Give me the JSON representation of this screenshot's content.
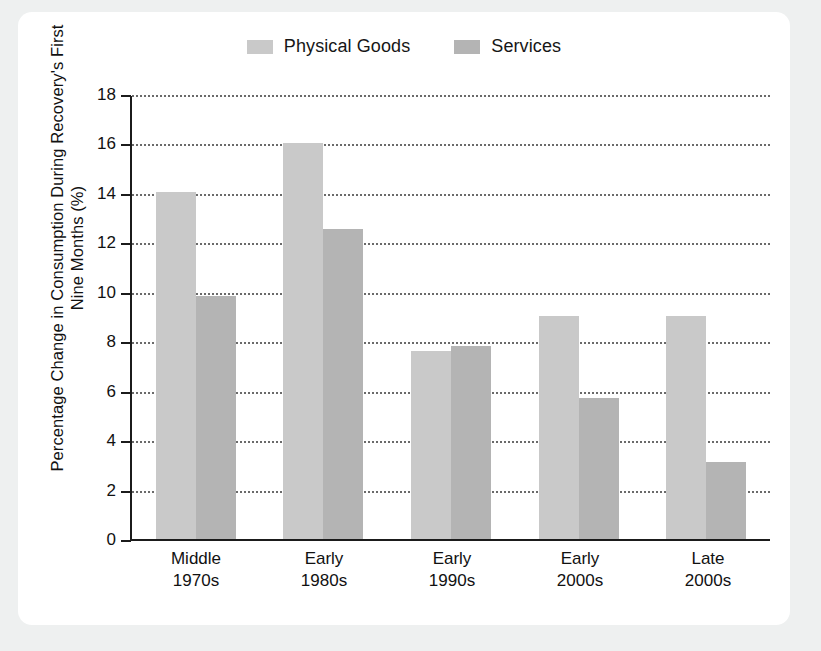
{
  "chart_data": {
    "type": "bar",
    "title": "",
    "xlabel": "",
    "ylabel": "Percentage Change in Consumption During Recovery's First Nine Months (%)",
    "ylim": [
      0,
      18
    ],
    "ytick_step": 2,
    "yticks": [
      "18",
      "16",
      "14",
      "12",
      "10",
      "8",
      "6",
      "4",
      "2",
      "0"
    ],
    "grid": true,
    "legend_position": "top-center",
    "categories": [
      "Middle 1970s",
      "Early 1980s",
      "Early 1990s",
      "Early 2000s",
      "Late 2000s"
    ],
    "category_lines": [
      {
        "line1": "Middle",
        "line2": "1970s"
      },
      {
        "line1": "Early",
        "line2": "1980s"
      },
      {
        "line1": "Early",
        "line2": "1990s"
      },
      {
        "line1": "Early",
        "line2": "2000s"
      },
      {
        "line1": "Late",
        "line2": "2000s"
      }
    ],
    "series": [
      {
        "name": "Physical Goods",
        "color": "#c9c9c9",
        "values": [
          14.0,
          16.0,
          7.6,
          9.0,
          9.0
        ]
      },
      {
        "name": "Services",
        "color": "#b4b4b4",
        "values": [
          9.8,
          12.5,
          7.8,
          5.7,
          3.1
        ]
      }
    ]
  },
  "colors": {
    "page_background": "#eef0f0",
    "card_background": "#ffffff",
    "axis": "#1b1b1b",
    "gridline": "#6a6a6a",
    "text": "#111111",
    "physical_goods": "#c9c9c9",
    "services": "#b4b4b4"
  }
}
